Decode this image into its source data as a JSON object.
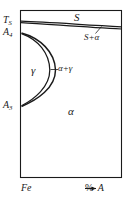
{
  "diagram": {
    "kind": "binary-phase-diagram",
    "frame": {
      "left": 20,
      "top": 10,
      "right": 122,
      "bottom": 178
    },
    "colors": {
      "line": "#1a1a1a",
      "background": "#ffffff",
      "text": "#1a1a1a"
    },
    "axis": {
      "x_left_label": "Fe",
      "x_right_label": "A",
      "x_unit_label": "%",
      "x_arrow": "→"
    },
    "temperature_labels": [
      {
        "id": "Ts",
        "base": "T",
        "sub": "S",
        "y": 21
      },
      {
        "id": "A4",
        "base": "A",
        "sub": "4",
        "y": 33
      },
      {
        "id": "A3",
        "base": "A",
        "sub": "3",
        "y": 106
      }
    ],
    "phase_fields": [
      {
        "id": "S",
        "label": "S",
        "x": 80,
        "y": 18
      },
      {
        "id": "S_plus_a",
        "label": "S+α",
        "x": 90,
        "y": 37
      },
      {
        "id": "gamma",
        "label": "γ",
        "x": 36,
        "y": 71
      },
      {
        "id": "a_plus_g",
        "label": "α+γ",
        "x": 63,
        "y": 69
      },
      {
        "id": "alpha",
        "label": "α",
        "x": 72,
        "y": 112
      }
    ],
    "curves": {
      "liquidus": {
        "left_y": 21,
        "right_y": 27
      },
      "solidus": {
        "left_y": 23,
        "right_y": 29
      },
      "gamma_loop_outer": {
        "top_y": 33,
        "bottom_y": 106,
        "max_x": 55
      },
      "gamma_loop_inner": {
        "top_y": 33,
        "bottom_y": 106,
        "max_x": 48
      }
    },
    "leaders": [
      {
        "id": "leader-S-plus-alpha",
        "from_x": 96,
        "from_y": 33,
        "to_x": 102,
        "to_y": 26
      },
      {
        "id": "leader-alpha-plus-gamma",
        "from_x": 58,
        "from_y": 69,
        "to_x": 51,
        "to_y": 69
      }
    ]
  }
}
